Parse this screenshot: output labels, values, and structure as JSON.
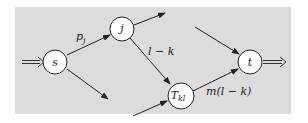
{
  "diagram": {
    "background_color": "#dcdcdc",
    "nodes": [
      {
        "id": "s",
        "label": "s"
      },
      {
        "id": "j",
        "label": "j"
      },
      {
        "id": "T",
        "label": "T",
        "subscript": "kl"
      },
      {
        "id": "t",
        "label": "t"
      }
    ],
    "edges": [
      {
        "from": "s",
        "to": "j",
        "label": "p",
        "label_sub": "j"
      },
      {
        "from": "j",
        "to": "T",
        "label": "l − k"
      },
      {
        "from": "T",
        "to": "t",
        "label": "m(l − k)"
      }
    ],
    "source_arrow": "input to s",
    "sink_arrow": "output from t"
  }
}
